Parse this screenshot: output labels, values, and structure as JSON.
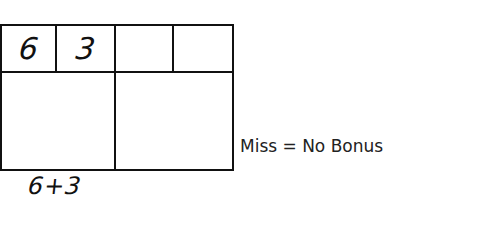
{
  "scorecard": {
    "frames": [
      {
        "ball1": "6",
        "ball2": "3",
        "total": ""
      },
      {
        "ball1": "",
        "ball2": "",
        "total": ""
      }
    ],
    "formula": "6+3",
    "note": "Miss = No Bonus"
  }
}
